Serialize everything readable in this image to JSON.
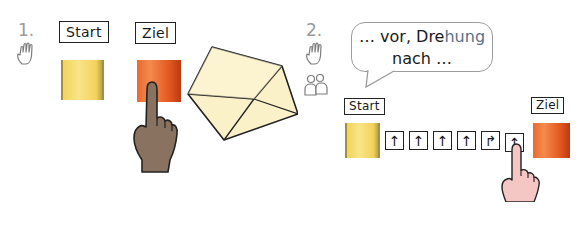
{
  "task1": {
    "number": "1.",
    "icons": [
      "hand-icon"
    ],
    "start_label": "Start",
    "goal_label": "Ziel",
    "colors": {
      "start": "#f6dc72",
      "goal": "#e8642a",
      "hand": "#8a7260",
      "paper": "#fbf1c8"
    }
  },
  "task2": {
    "number": "2.",
    "icons": [
      "hand-icon",
      "partner-icon"
    ],
    "speech": {
      "line1_a": "… vor, Dre",
      "line1_b": "hung",
      "line2": "nach …"
    },
    "start_label": "Start",
    "goal_label": "Ziel",
    "commands": [
      {
        "type": "forward",
        "glyph": "↑"
      },
      {
        "type": "forward",
        "glyph": "↑"
      },
      {
        "type": "forward",
        "glyph": "↑"
      },
      {
        "type": "forward",
        "glyph": "↑"
      },
      {
        "type": "turn-right",
        "glyph": "↱"
      },
      {
        "type": "forward",
        "glyph": "↑"
      }
    ],
    "colors": {
      "start": "#f6dc72",
      "goal": "#e8642a",
      "hand": "#f4c6c4"
    }
  }
}
